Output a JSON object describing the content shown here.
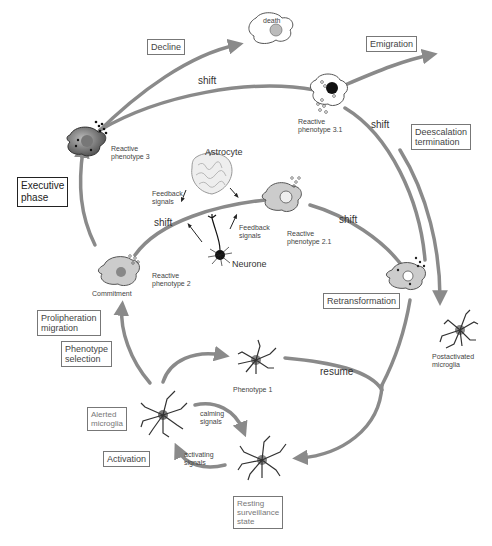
{
  "colors": {
    "arrow": "#8a8a8a",
    "cell_fill": "#c8c8c8",
    "cell_stroke": "#555555",
    "text": "#333333",
    "box_border": "#777777"
  },
  "boxes": {
    "decline": "Decline",
    "emigration": "Emigration",
    "deescalation": "Deescalation\ntermination",
    "executive_phase": "Executive\nphase",
    "proliferation": "Prolipheration\nmigration",
    "phenotype_selection": "Phenotype\nselection",
    "retransformation": "Retransformation",
    "alerted_microglia": "Alerted\nmicroglia",
    "activation": "Activation",
    "resting": "Resting\nsurveillance\nstate"
  },
  "labels": {
    "death": "death",
    "reactive_3": "Reactive\nphenotype 3",
    "reactive_3_1": "Reactive\nphenotype 3.1",
    "reactive_2": "Reactive\nphenotype 2",
    "reactive_2_1": "Reactive\nphenotype 2.1",
    "commitment": "Commitment",
    "astrocyte": "Astrocyte",
    "neurone": "Neurone",
    "feedback_left": "Feedback\nsignals",
    "feedback_right": "Feedback\nsignals",
    "shift_top": "shift",
    "shift_right_top": "shift",
    "shift_mid_left": "shift",
    "shift_mid_right": "shift",
    "phenotype_1": "Phenotype 1",
    "resume": "resume",
    "calming": "calming\nsignals",
    "activating": "activating\nsignals",
    "postactivated": "Postactivated\nmicroglia"
  }
}
